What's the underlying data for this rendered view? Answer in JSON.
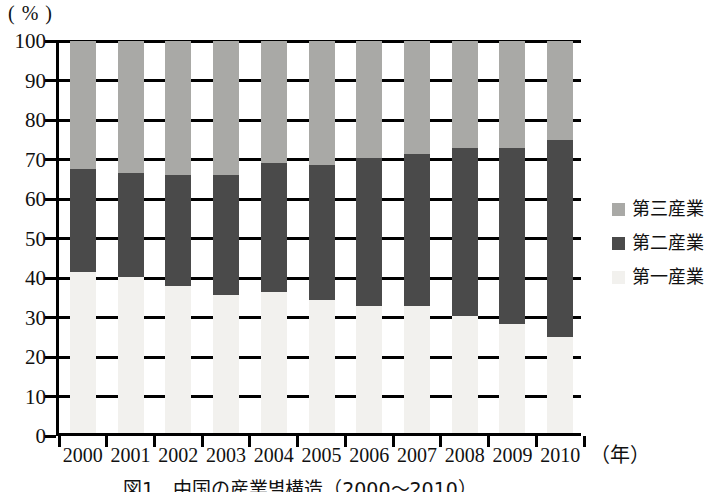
{
  "figure": {
    "unit_label": "( % )",
    "xaxis_unit": "（年）",
    "caption": "図1　中国の産業별構造（2000～2010）"
  },
  "legend": {
    "position": "right",
    "items": [
      {
        "label": "第三産業",
        "swatch": "tertiary-swatch",
        "color": "#a9a9a6"
      },
      {
        "label": "第二産業",
        "swatch": "secondary-swatch",
        "color": "#4a4a4a"
      },
      {
        "label": "第一産業",
        "swatch": "primary-swatch",
        "color": "#f2f1ee"
      }
    ]
  },
  "chart_data": {
    "type": "bar",
    "subtype": "stacked-percentage-column",
    "title": "",
    "xlabel": "（年）",
    "ylabel": "( % )",
    "ylim": [
      0,
      100
    ],
    "ytick_labels": [
      "0",
      "10",
      "20",
      "30",
      "40",
      "50",
      "60",
      "70",
      "80",
      "90",
      "100"
    ],
    "ytick_values": [
      0,
      10,
      20,
      30,
      40,
      50,
      60,
      70,
      80,
      90,
      100
    ],
    "grid": true,
    "grid_axis": "y",
    "categories": [
      "2000",
      "2001",
      "2002",
      "2003",
      "2004",
      "2005",
      "2006",
      "2007",
      "2008",
      "2009",
      "2010"
    ],
    "series": [
      {
        "name": "第一産業",
        "color": "#f2f1ee",
        "values": [
          41.5,
          40.3,
          38.0,
          35.7,
          36.5,
          34.5,
          32.9,
          33.0,
          30.5,
          28.3,
          25.0
        ]
      },
      {
        "name": "第二産業",
        "color": "#4a4a4a",
        "values": [
          26.0,
          26.2,
          28.0,
          30.3,
          32.5,
          34.0,
          37.4,
          38.5,
          42.5,
          44.7,
          50.0
        ]
      },
      {
        "name": "第三産業",
        "color": "#a9a9a6",
        "values": [
          32.5,
          33.5,
          34.0,
          34.0,
          31.0,
          31.5,
          29.7,
          28.5,
          27.0,
          27.0,
          25.0
        ]
      }
    ],
    "cumulative_tops": {
      "第一産業": [
        41.5,
        40.3,
        38.0,
        35.7,
        36.5,
        34.5,
        32.9,
        33.0,
        30.5,
        28.3,
        25.0
      ],
      "第二産業": [
        67.5,
        66.5,
        66.0,
        66.0,
        69.0,
        68.5,
        70.3,
        71.5,
        73.0,
        73.0,
        75.0
      ],
      "第三産業": [
        100,
        100,
        100,
        100,
        100,
        100,
        100,
        100,
        100,
        100,
        100
      ]
    }
  }
}
